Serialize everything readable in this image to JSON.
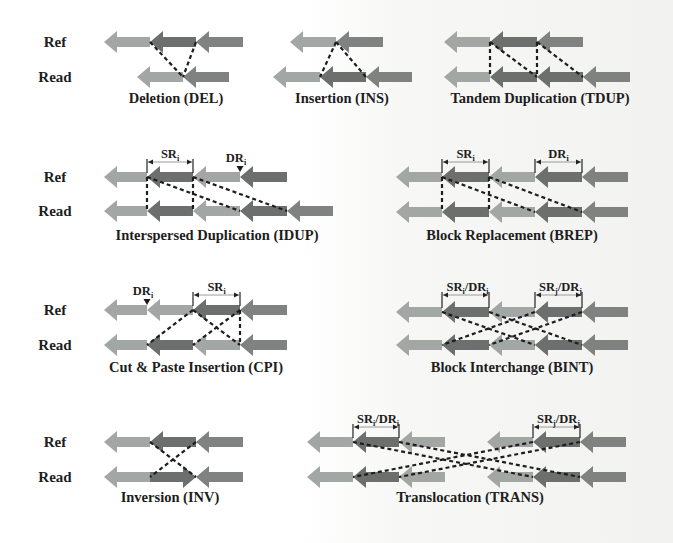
{
  "colors": {
    "light": "#a2a6a5",
    "dark": "#6c6f6e",
    "mid": "#7f8281",
    "dash": "#1e1e1e",
    "text": "#1d1d1d"
  },
  "row_labels": {
    "ref": "Ref",
    "read": "Read"
  },
  "panels": [
    {
      "id": "del",
      "caption": "Deletion (DEL)",
      "caption_pos": [
        176,
        103
      ],
      "label_rows": [
        42,
        77
      ],
      "ref": {
        "y": 42,
        "segs": [
          [
            104,
            150,
            "light",
            "L"
          ],
          [
            150,
            196,
            "dark",
            "L"
          ],
          [
            196,
            243,
            "mid",
            "L"
          ]
        ]
      },
      "read": {
        "y": 77,
        "segs": [
          [
            137,
            183,
            "light",
            "L"
          ],
          [
            183,
            229,
            "mid",
            "L"
          ]
        ]
      },
      "dashes": [
        [
          [
            150,
            42
          ],
          [
            183,
            77
          ]
        ],
        [
          [
            196,
            42
          ],
          [
            183,
            77
          ]
        ]
      ],
      "brackets": [],
      "markers": []
    },
    {
      "id": "ins",
      "caption": "Insertion (INS)",
      "caption_pos": [
        342,
        103
      ],
      "ref": {
        "y": 42,
        "segs": [
          [
            290,
            336,
            "light",
            "L"
          ],
          [
            336,
            383,
            "mid",
            "L"
          ]
        ]
      },
      "read": {
        "y": 77,
        "segs": [
          [
            273,
            320,
            "light",
            "L"
          ],
          [
            320,
            366,
            "dark",
            "L"
          ],
          [
            366,
            412,
            "mid",
            "L"
          ]
        ]
      },
      "dashes": [
        [
          [
            336,
            42
          ],
          [
            320,
            77
          ]
        ],
        [
          [
            336,
            42
          ],
          [
            366,
            77
          ]
        ]
      ],
      "brackets": [],
      "markers": []
    },
    {
      "id": "tdup",
      "caption": "Tandem Duplication (TDUP)",
      "caption_pos": [
        540,
        103
      ],
      "ref": {
        "y": 42,
        "segs": [
          [
            444,
            490,
            "light",
            "L"
          ],
          [
            490,
            537,
            "dark",
            "L"
          ],
          [
            537,
            583,
            "mid",
            "L"
          ]
        ]
      },
      "read": {
        "y": 77,
        "segs": [
          [
            444,
            490,
            "light",
            "L"
          ],
          [
            490,
            537,
            "dark",
            "L"
          ],
          [
            537,
            583,
            "dark",
            "L"
          ],
          [
            583,
            630,
            "mid",
            "L"
          ]
        ]
      },
      "dashes": [
        [
          [
            490,
            42
          ],
          [
            490,
            77
          ]
        ],
        [
          [
            537,
            42
          ],
          [
            537,
            77
          ]
        ],
        [
          [
            490,
            42
          ],
          [
            537,
            77
          ]
        ],
        [
          [
            537,
            42
          ],
          [
            583,
            77
          ]
        ]
      ],
      "brackets": [],
      "markers": []
    },
    {
      "id": "idup",
      "caption": "Interspersed Duplication (IDUP)",
      "caption_pos": [
        217,
        240
      ],
      "label_rows": [
        177,
        211
      ],
      "ref": {
        "y": 177,
        "segs": [
          [
            104,
            147,
            "light",
            "L"
          ],
          [
            147,
            193,
            "dark",
            "L"
          ],
          [
            193,
            240,
            "light",
            "L"
          ],
          [
            240,
            287,
            "dark",
            "L"
          ]
        ]
      },
      "read": {
        "y": 211,
        "segs": [
          [
            104,
            147,
            "light",
            "L"
          ],
          [
            147,
            193,
            "dark",
            "L"
          ],
          [
            193,
            240,
            "light",
            "L"
          ],
          [
            240,
            287,
            "dark",
            "L"
          ],
          [
            287,
            333,
            "mid",
            "L"
          ]
        ]
      },
      "dashes": [
        [
          [
            147,
            177
          ],
          [
            147,
            211
          ]
        ],
        [
          [
            193,
            177
          ],
          [
            193,
            211
          ]
        ],
        [
          [
            147,
            177
          ],
          [
            240,
            211
          ]
        ],
        [
          [
            193,
            177
          ],
          [
            287,
            211
          ]
        ]
      ],
      "brackets": [
        {
          "x1": 147,
          "x2": 193,
          "y": 162,
          "label": "SR",
          "sub": "i"
        }
      ],
      "markers": [
        {
          "x": 240,
          "y": 166,
          "label": "DR",
          "sub": "i"
        }
      ]
    },
    {
      "id": "brep",
      "caption": "Block Replacement (BREP)",
      "caption_pos": [
        512,
        240
      ],
      "ref": {
        "y": 177,
        "segs": [
          [
            396,
            442,
            "light",
            "L"
          ],
          [
            442,
            489,
            "dark",
            "L"
          ],
          [
            489,
            535,
            "light",
            "L"
          ],
          [
            535,
            582,
            "dark",
            "L"
          ],
          [
            582,
            628,
            "mid",
            "L"
          ]
        ]
      },
      "read": {
        "y": 212,
        "segs": [
          [
            396,
            442,
            "light",
            "L"
          ],
          [
            442,
            489,
            "dark",
            "L"
          ],
          [
            489,
            535,
            "light",
            "L"
          ],
          [
            535,
            582,
            "dark",
            "L"
          ],
          [
            582,
            628,
            "mid",
            "L"
          ]
        ]
      },
      "dashes": [
        [
          [
            442,
            177
          ],
          [
            442,
            212
          ]
        ],
        [
          [
            489,
            177
          ],
          [
            489,
            212
          ]
        ],
        [
          [
            442,
            177
          ],
          [
            535,
            212
          ]
        ],
        [
          [
            489,
            177
          ],
          [
            582,
            212
          ]
        ]
      ],
      "brackets": [
        {
          "x1": 442,
          "x2": 489,
          "y": 162,
          "label": "SR",
          "sub": "i"
        },
        {
          "x1": 535,
          "x2": 582,
          "y": 162,
          "label": "DR",
          "sub": "i"
        }
      ],
      "markers": []
    },
    {
      "id": "cpi",
      "caption": "Cut & Paste Insertion (CPI)",
      "caption_pos": [
        196,
        372
      ],
      "label_rows": [
        310,
        345
      ],
      "ref": {
        "y": 310,
        "segs": [
          [
            104,
            147,
            "light",
            "L"
          ],
          [
            147,
            193,
            "light",
            "L"
          ],
          [
            193,
            240,
            "dark",
            "L"
          ],
          [
            240,
            287,
            "mid",
            "L"
          ]
        ]
      },
      "read": {
        "y": 345,
        "segs": [
          [
            104,
            147,
            "light",
            "L"
          ],
          [
            147,
            193,
            "dark",
            "L"
          ],
          [
            193,
            240,
            "light",
            "L"
          ],
          [
            240,
            287,
            "mid",
            "L"
          ]
        ]
      },
      "dashes": [
        [
          [
            193,
            310
          ],
          [
            147,
            345
          ]
        ],
        [
          [
            240,
            310
          ],
          [
            193,
            345
          ]
        ],
        [
          [
            193,
            310
          ],
          [
            240,
            345
          ]
        ],
        [
          [
            240,
            310
          ],
          [
            240,
            345
          ]
        ]
      ],
      "brackets": [
        {
          "x1": 193,
          "x2": 240,
          "y": 295,
          "label": "SR",
          "sub": "i"
        }
      ],
      "markers": [
        {
          "x": 147,
          "y": 299,
          "label": "DR",
          "sub": "i"
        }
      ]
    },
    {
      "id": "bint",
      "caption": "Block Interchange (BINT)",
      "caption_pos": [
        512,
        372
      ],
      "ref": {
        "y": 312,
        "segs": [
          [
            396,
            442,
            "light",
            "L"
          ],
          [
            442,
            489,
            "dark",
            "L"
          ],
          [
            489,
            535,
            "light",
            "L"
          ],
          [
            535,
            582,
            "dark",
            "L"
          ],
          [
            582,
            628,
            "mid",
            "L"
          ]
        ]
      },
      "read": {
        "y": 345,
        "segs": [
          [
            396,
            442,
            "light",
            "L"
          ],
          [
            442,
            489,
            "dark",
            "L"
          ],
          [
            489,
            535,
            "light",
            "L"
          ],
          [
            535,
            582,
            "dark",
            "L"
          ],
          [
            582,
            628,
            "mid",
            "L"
          ]
        ]
      },
      "dashes": [
        [
          [
            442,
            312
          ],
          [
            535,
            345
          ]
        ],
        [
          [
            489,
            312
          ],
          [
            582,
            345
          ]
        ],
        [
          [
            535,
            312
          ],
          [
            442,
            345
          ]
        ],
        [
          [
            582,
            312
          ],
          [
            489,
            345
          ]
        ]
      ],
      "brackets": [
        {
          "x1": 442,
          "x2": 489,
          "y": 295,
          "label": "SR",
          "sub": "i",
          "label2": "/DR",
          "sub2": "i"
        },
        {
          "x1": 535,
          "x2": 582,
          "y": 295,
          "label": "SR",
          "sub": "j",
          "label2": "/DR",
          "sub2": "j"
        }
      ],
      "markers": []
    },
    {
      "id": "inv",
      "caption": "Inversion (INV)",
      "caption_pos": [
        170,
        502
      ],
      "label_rows": [
        442,
        477
      ],
      "ref": {
        "y": 442,
        "segs": [
          [
            104,
            150,
            "light",
            "L"
          ],
          [
            150,
            196,
            "dark",
            "L"
          ],
          [
            196,
            243,
            "mid",
            "L"
          ]
        ]
      },
      "read": {
        "y": 477,
        "segs": [
          [
            104,
            150,
            "light",
            "L"
          ],
          [
            150,
            196,
            "dark",
            "R"
          ],
          [
            196,
            243,
            "mid",
            "L"
          ]
        ]
      },
      "dashes": [
        [
          [
            150,
            442
          ],
          [
            196,
            477
          ]
        ],
        [
          [
            196,
            442
          ],
          [
            150,
            477
          ]
        ]
      ],
      "brackets": [],
      "markers": []
    },
    {
      "id": "trans",
      "caption": "Translocation (TRANS)",
      "caption_pos": [
        470,
        502
      ],
      "ref": {
        "y": 442,
        "segs": [
          [
            307,
            353,
            "light",
            "L"
          ],
          [
            353,
            399,
            "dark",
            "L"
          ],
          [
            399,
            445,
            "light",
            "L"
          ],
          [
            487,
            533,
            "light",
            "L"
          ],
          [
            533,
            580,
            "dark",
            "L"
          ],
          [
            580,
            626,
            "mid",
            "L"
          ]
        ]
      },
      "read": {
        "y": 477,
        "segs": [
          [
            307,
            353,
            "light",
            "L"
          ],
          [
            353,
            399,
            "dark",
            "L"
          ],
          [
            399,
            445,
            "light",
            "L"
          ],
          [
            487,
            533,
            "light",
            "L"
          ],
          [
            533,
            580,
            "dark",
            "L"
          ],
          [
            580,
            626,
            "mid",
            "L"
          ]
        ]
      },
      "dashes": [
        [
          [
            353,
            442
          ],
          [
            533,
            477
          ]
        ],
        [
          [
            399,
            442
          ],
          [
            580,
            477
          ]
        ],
        [
          [
            533,
            442
          ],
          [
            353,
            477
          ]
        ],
        [
          [
            580,
            442
          ],
          [
            399,
            477
          ]
        ]
      ],
      "brackets": [
        {
          "x1": 353,
          "x2": 399,
          "y": 427,
          "label": "SR",
          "sub": "i",
          "label2": "/DR",
          "sub2": "i"
        },
        {
          "x1": 533,
          "x2": 580,
          "y": 427,
          "label": "SR",
          "sub": "j",
          "label2": "/DR",
          "sub2": "j"
        }
      ],
      "markers": []
    }
  ]
}
